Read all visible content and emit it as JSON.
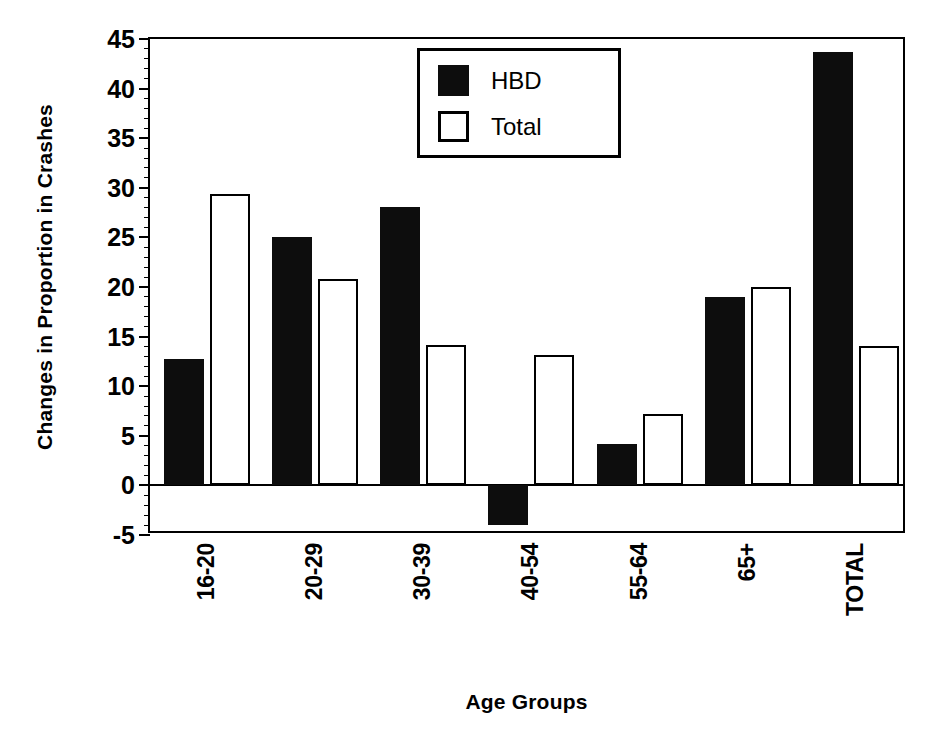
{
  "chart_data": {
    "type": "bar",
    "title": "",
    "xlabel": "Age Groups",
    "ylabel": "Changes in Proportion in Crashes",
    "categories": [
      "16-20",
      "20-29",
      "30-39",
      "40-54",
      "55-64",
      "65+",
      "TOTAL"
    ],
    "series": [
      {
        "name": "HBD",
        "values": [
          12.7,
          25.0,
          28.1,
          -4.0,
          4.2,
          19.0,
          43.7
        ],
        "color": "#0d0d0d",
        "style": "filled"
      },
      {
        "name": "Total",
        "values": [
          29.4,
          20.8,
          14.2,
          13.1,
          7.2,
          20.0,
          14.1
        ],
        "color": "#ffffff",
        "style": "hollow"
      }
    ],
    "ylim": [
      -5,
      45
    ],
    "ytick_labels": [
      "45",
      "40",
      "35",
      "30",
      "25",
      "20",
      "15",
      "10",
      "5",
      "0",
      "-5"
    ],
    "ytick_values": [
      45,
      40,
      35,
      30,
      25,
      20,
      15,
      10,
      5,
      0,
      -5
    ],
    "ytick_minor_step": 1,
    "grid": false,
    "legend_position": "top-center",
    "legend_entries": [
      "HBD",
      "Total"
    ],
    "zero_line": 0
  },
  "axis": {
    "y_title": "Changes in Proportion in Crashes",
    "x_title": "Age Groups"
  },
  "legend": {
    "items": [
      {
        "label": "HBD"
      },
      {
        "label": "Total"
      }
    ]
  },
  "colors": {
    "hbd": "#0d0d0d",
    "total_fill": "#ffffff",
    "axis": "#000000",
    "background": "#ffffff"
  }
}
